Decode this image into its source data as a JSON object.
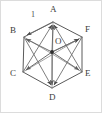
{
  "figure": {
    "kind": "geometry-diagram",
    "title_visible": false,
    "background_color": "#ffffff",
    "frame": {
      "visible": true,
      "color": "#d9d9d9",
      "width_px": 102,
      "height_px": 113
    },
    "stroke": {
      "hexagon_color": "#5a5a5a",
      "vector_color": "#6b6b6b",
      "diagonal_color": "#8a8a8a",
      "center_dot_color": "#2e2e2e"
    },
    "shape": {
      "name": "regular-hexagon",
      "vertex_count": 6,
      "center_label": "O"
    },
    "vertices": [
      {
        "id": "A",
        "label": "A",
        "x": 53,
        "y": 22,
        "label_x": 50,
        "label_y": 9,
        "label_name": "vertex-label-a"
      },
      {
        "id": "B",
        "label": "B",
        "x": 24,
        "y": 37,
        "label_x": 11,
        "label_y": 30,
        "label_name": "vertex-label-b"
      },
      {
        "id": "C",
        "label": "C",
        "x": 23,
        "y": 72,
        "label_x": 11,
        "label_y": 72,
        "label_name": "vertex-label-c"
      },
      {
        "id": "D",
        "label": "D",
        "x": 52,
        "y": 88,
        "label_x": 49,
        "label_y": 96,
        "label_name": "vertex-label-d"
      },
      {
        "id": "E",
        "label": "E",
        "x": 82,
        "y": 72,
        "label_x": 85,
        "label_y": 72,
        "label_name": "vertex-label-e"
      },
      {
        "id": "F",
        "label": "F",
        "x": 82,
        "y": 37,
        "label_x": 85,
        "label_y": 29,
        "label_name": "vertex-label-f"
      }
    ],
    "center": {
      "id": "O",
      "label": "O",
      "x": 52,
      "y": 52,
      "label_x": 55,
      "label_y": 41,
      "dot_radius": 1.9
    },
    "edges": [
      {
        "from": "A",
        "to": "B"
      },
      {
        "from": "B",
        "to": "C"
      },
      {
        "from": "C",
        "to": "D"
      },
      {
        "from": "D",
        "to": "E"
      },
      {
        "from": "E",
        "to": "F"
      },
      {
        "from": "F",
        "to": "A"
      }
    ],
    "vectors_from_center": [
      {
        "from": "O",
        "to": "A",
        "arrow": true
      },
      {
        "from": "O",
        "to": "B",
        "arrow": true
      },
      {
        "from": "O",
        "to": "C",
        "arrow": true
      },
      {
        "from": "O",
        "to": "D",
        "arrow": true
      },
      {
        "from": "O",
        "to": "E",
        "arrow": true
      },
      {
        "from": "O",
        "to": "F",
        "arrow": true
      }
    ],
    "long_diagonals": [
      {
        "from": "A",
        "to": "D"
      },
      {
        "from": "B",
        "to": "E"
      },
      {
        "from": "C",
        "to": "F"
      }
    ],
    "extra_vectors": [
      {
        "from": "C",
        "to": "A",
        "arrow": true
      },
      {
        "from": "E",
        "to": "A",
        "arrow": true
      },
      {
        "from": "B",
        "to": "D",
        "arrow": true
      },
      {
        "from": "F",
        "to": "D",
        "arrow": true
      },
      {
        "from": "A",
        "to": "B",
        "arrow": true
      },
      {
        "from": "A",
        "to": "F",
        "arrow": true
      },
      {
        "from": "C",
        "to": "D",
        "arrow": true
      },
      {
        "from": "E",
        "to": "D",
        "arrow": true
      }
    ],
    "edge_labels": [
      {
        "text": "1",
        "x": 31,
        "y": 14,
        "for_edge": "A-B",
        "name": "edge-length-label-ab"
      }
    ]
  }
}
